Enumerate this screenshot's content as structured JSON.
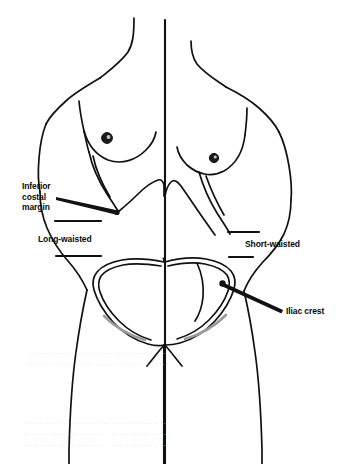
{
  "figure": {
    "midline_label": "body-midline"
  },
  "labels": {
    "inferior_costal_margin": "Inferior\ncostal\nmargin",
    "long_waisted": "Long-waisted",
    "short_waisted": "Short-waisted",
    "iliac_crest": "Iliac crest"
  },
  "anatomy_parts": [
    "neck",
    "left-shoulder",
    "right-shoulder",
    "left-arm",
    "right-arm",
    "left-breast",
    "right-breast",
    "left-nipple",
    "right-nipple",
    "costal-margin",
    "pelvis-outline",
    "iliac-crest-point",
    "left-thigh",
    "right-thigh"
  ],
  "colors": {
    "ink": "#111111",
    "paper": "#ffffff",
    "bleed_through": "#d8d8d8"
  },
  "bleed_through_text": {
    "upper": "   ·· ···· ·· ···· ····· ·· ··· ···· ··· ·· ····· ··· ···· ··\n  ·· ·· ··· ··· ···· ···· ·· ··· ····· ·· ··· ··  ···· ·· ·",
    "lower": "  ··· ··· ····· ··· ·· ··· ···· ··· ·· ····· ·· ···· ·· ··\n ·· ··· ··· ····· ···· ··· ···· ·· ··· ···· ···· ·· ·· ··· ·\n ··· ···· ···· ·· ··· ····· ··· ··· ···· ·· ··· ···· ·· ····"
  }
}
